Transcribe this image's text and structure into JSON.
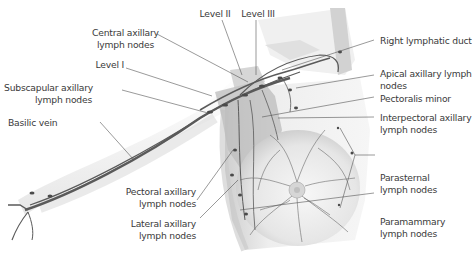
{
  "figure": {
    "labels_left": {
      "central_axillary": [
        "Central axillary",
        "lymph nodes"
      ],
      "level_i": "Level I",
      "subscapular": [
        "Subscapular axillary",
        "lymph nodes"
      ],
      "basilic_vein": "Basilic vein",
      "pectoral_axillary": [
        "Pectoral axillary",
        "lymph nodes"
      ],
      "lateral_axillary": [
        "Lateral axillary",
        "lymph nodes"
      ]
    },
    "labels_top": {
      "level_ii": "Level II",
      "level_iii": "Level III"
    },
    "labels_right": {
      "right_lymphatic_duct": "Right lymphatic duct",
      "apical_axillary": [
        "Apical axillary lymph",
        "nodes"
      ],
      "pectoralis_minor": "Pectoralis minor",
      "interpectoral": [
        "Interpectoral axillary",
        "lymph nodes"
      ],
      "parasternal": [
        "Parasternal",
        "lymph nodes"
      ],
      "paramammary": [
        "Paramammary",
        "lymph nodes"
      ]
    },
    "colors": {
      "text": "#3a3a3a",
      "leader_line": "#555555",
      "vessel": "#5a5a5a",
      "skin_shadow": "#d8d8d8",
      "muscle": "#bdbdbd"
    }
  }
}
